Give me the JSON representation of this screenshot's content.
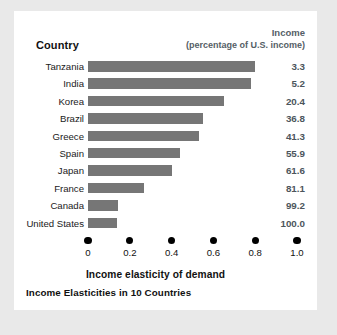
{
  "card": {
    "column_header_country": "Country",
    "income_header_line1": "Income",
    "income_header_line2": "(percentage of U.S. income)",
    "x_axis_title": "Income elasticity of demand",
    "caption": "Income Elasticities in 10 Countries",
    "bar_color": "#767676",
    "background_color": "#ffffff",
    "page_background_color": "#e9e9e9"
  },
  "chart_data": {
    "type": "bar",
    "orientation": "horizontal",
    "title": "Income Elasticities in 10 Countries",
    "xlabel": "Income elasticity of demand",
    "ylabel": "Country",
    "xlim": [
      0,
      1.0
    ],
    "xticks": [
      "0",
      "0.2",
      "0.4",
      "0.6",
      "0.8",
      "1.0"
    ],
    "xtick_values": [
      0,
      0.2,
      0.4,
      0.6,
      0.8,
      1.0
    ],
    "grid": false,
    "legend": false,
    "categories": [
      "Tanzania",
      "India",
      "Korea",
      "Brazil",
      "Greece",
      "Spain",
      "Japan",
      "France",
      "Canada",
      "United States"
    ],
    "values": [
      0.8,
      0.78,
      0.65,
      0.55,
      0.53,
      0.44,
      0.4,
      0.27,
      0.145,
      0.14
    ],
    "annotations": {
      "column": "Income (percentage of U.S. income)",
      "values": [
        "3.3",
        "5.2",
        "20.4",
        "36.8",
        "41.3",
        "55.9",
        "61.6",
        "81.1",
        "99.2",
        "100.0"
      ]
    },
    "rows": [
      {
        "country": "Tanzania",
        "elasticity": 0.8,
        "income_pct": "3.3"
      },
      {
        "country": "India",
        "elasticity": 0.78,
        "income_pct": "5.2"
      },
      {
        "country": "Korea",
        "elasticity": 0.65,
        "income_pct": "20.4"
      },
      {
        "country": "Brazil",
        "elasticity": 0.55,
        "income_pct": "36.8"
      },
      {
        "country": "Greece",
        "elasticity": 0.53,
        "income_pct": "41.3"
      },
      {
        "country": "Spain",
        "elasticity": 0.44,
        "income_pct": "55.9"
      },
      {
        "country": "Japan",
        "elasticity": 0.4,
        "income_pct": "61.6"
      },
      {
        "country": "France",
        "elasticity": 0.27,
        "income_pct": "81.1"
      },
      {
        "country": "Canada",
        "elasticity": 0.145,
        "income_pct": "99.2"
      },
      {
        "country": "United States",
        "elasticity": 0.14,
        "income_pct": "100.0"
      }
    ]
  }
}
